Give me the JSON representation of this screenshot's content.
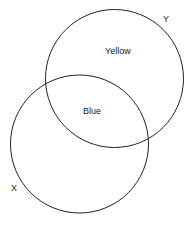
{
  "diagram": {
    "type": "venn",
    "circles": [
      {
        "id": "Y",
        "label": "Y",
        "region_label": "Yellow"
      },
      {
        "id": "X",
        "label": "X"
      }
    ],
    "intersection_label": "Blue",
    "stroke_color": "#222222"
  }
}
